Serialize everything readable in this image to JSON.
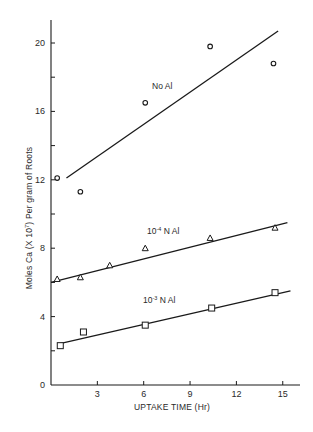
{
  "chart_data": {
    "type": "scatter",
    "title": "",
    "xlabel": "UPTAKE TIME (Hr)",
    "ylabel": "Moles Ca (X 10⁻⁷) Per gram of Roots",
    "xlim": [
      0,
      15.5
    ],
    "ylim": [
      0,
      21.5
    ],
    "x_ticks": [
      3,
      6,
      9,
      12,
      15
    ],
    "x_tick_labels": [
      "3",
      "6",
      "9",
      "12",
      "15"
    ],
    "y_ticks": [
      0,
      2,
      4,
      6,
      8,
      10,
      12,
      14,
      16,
      18,
      20
    ],
    "y_tick_labels": [
      "0",
      "",
      "4",
      "",
      "8",
      "",
      "12",
      "",
      "16",
      "",
      "20"
    ],
    "grid": false,
    "legend": "inline labels next to fitted lines",
    "series": [
      {
        "name": "No Al",
        "label_base": "No Al",
        "label_exp": "",
        "label_suffix": "",
        "marker": "circle",
        "points": [
          [
            0.4,
            12.1
          ],
          [
            1.9,
            11.3
          ],
          [
            6.1,
            16.5
          ],
          [
            10.3,
            19.8
          ],
          [
            14.4,
            18.8
          ]
        ],
        "fit_line": [
          [
            1.0,
            12.1
          ],
          [
            14.7,
            20.7
          ]
        ],
        "label_pos": [
          152,
          89
        ]
      },
      {
        "name": "10^-4 N Al",
        "label_base": "10",
        "label_exp": "-4",
        "label_suffix": " N Al",
        "marker": "triangle",
        "points": [
          [
            0.4,
            6.2
          ],
          [
            1.9,
            6.3
          ],
          [
            3.8,
            7.0
          ],
          [
            6.1,
            8.0
          ],
          [
            10.3,
            8.6
          ],
          [
            14.5,
            9.2
          ]
        ],
        "fit_line": [
          [
            0.0,
            6.0
          ],
          [
            15.3,
            9.5
          ]
        ],
        "label_pos": [
          147,
          234
        ]
      },
      {
        "name": "10^-3 N Al",
        "label_base": "10",
        "label_exp": "-3",
        "label_suffix": " N Al",
        "marker": "square",
        "points": [
          [
            0.6,
            2.3
          ],
          [
            2.1,
            3.1
          ],
          [
            6.1,
            3.5
          ],
          [
            10.4,
            4.5
          ],
          [
            14.5,
            5.4
          ]
        ],
        "fit_line": [
          [
            0.5,
            2.4
          ],
          [
            15.5,
            5.5
          ]
        ],
        "label_pos": [
          143,
          303
        ]
      }
    ]
  },
  "axis": {
    "x_title": "UPTAKE TIME (Hr)",
    "y_title_pre": "Moles Ca (",
    "y_title_x": "X",
    "y_title_mid": " 10",
    "y_title_exp": "7",
    "y_title_post": ") Per gram of Roots"
  },
  "colors": {
    "ink": "#1a1a1a",
    "background": "#ffffff"
  }
}
